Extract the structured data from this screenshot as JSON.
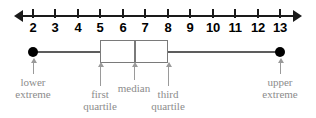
{
  "figure": {
    "type": "box-and-whisker-plot",
    "title": ""
  },
  "axis": {
    "ticks": [
      {
        "value": 2,
        "label": "2",
        "x": 33
      },
      {
        "value": 3,
        "label": "3",
        "x": 55
      },
      {
        "value": 4,
        "label": "4",
        "x": 78
      },
      {
        "value": 5,
        "label": "5",
        "x": 100
      },
      {
        "value": 6,
        "label": "6",
        "x": 123
      },
      {
        "value": 7,
        "label": "7",
        "x": 145
      },
      {
        "value": 8,
        "label": "8",
        "x": 168
      },
      {
        "value": 9,
        "label": "9",
        "x": 190
      },
      {
        "value": 10,
        "label": "10",
        "x": 213
      },
      {
        "value": 11,
        "label": "11",
        "x": 235
      },
      {
        "value": 12,
        "label": "12",
        "x": 258
      },
      {
        "value": 13,
        "label": "13",
        "x": 280
      }
    ],
    "arrow_left": "left-arrowhead",
    "arrow_right": "right-arrowhead"
  },
  "chart_data": {
    "type": "box",
    "title": "",
    "xlabel": "",
    "ylabel": "",
    "xlim": [
      2,
      13
    ],
    "grid": false,
    "legend": "none",
    "tick_labels": [
      "2",
      "3",
      "4",
      "5",
      "6",
      "7",
      "8",
      "9",
      "10",
      "11",
      "12",
      "13"
    ],
    "five_number_summary": {
      "lower_extreme": 2,
      "first_quartile": 5,
      "median": 6.5,
      "third_quartile": 8,
      "upper_extreme": 13
    },
    "annotations": [
      {
        "key": "lower_extreme",
        "text": "lower\nextreme",
        "value": 2
      },
      {
        "key": "first_quartile",
        "text": "first\nquartile",
        "value": 5
      },
      {
        "key": "median",
        "text": "median",
        "value": 6.5
      },
      {
        "key": "third_quartile",
        "text": "third\nquartile",
        "value": 8
      },
      {
        "key": "upper_extreme",
        "text": "upper\nextreme",
        "value": 13
      }
    ]
  },
  "plot": {
    "lower_extreme_x": 33,
    "first_quartile_x": 100,
    "median_x": 134,
    "third_quartile_x": 168,
    "upper_extreme_x": 280
  },
  "labels": {
    "lower_extreme": "lower\nextreme",
    "first_quartile": "first\nquartile",
    "median": "median",
    "third_quartile": "third\nquartile",
    "upper_extreme": "upper\nextreme"
  },
  "colors": {
    "axis": "#1a1a1a",
    "box_stroke": "#7a7a7a",
    "whisker": "#5d5d5d",
    "dot": "#000000",
    "callout": "#8c8c8c",
    "background": "#ffffff"
  }
}
